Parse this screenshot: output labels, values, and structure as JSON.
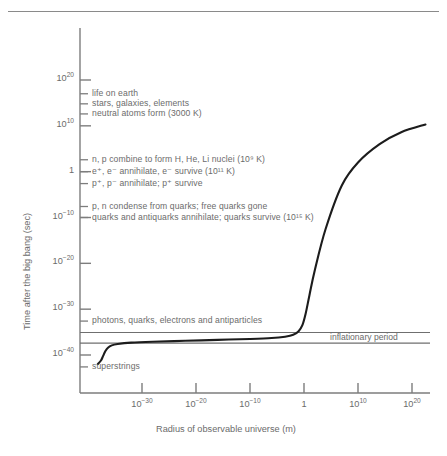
{
  "chart_data": {
    "type": "line",
    "title": "",
    "xlabel": "Radius of observable universe (m)",
    "ylabel": "Time after the big bang (sec)",
    "xscale": "log",
    "yscale": "log",
    "xlim": [
      -45,
      25
    ],
    "ylim": [
      -45,
      25
    ],
    "grid": false,
    "legend": null,
    "xticks": [
      {
        "exp": "-30",
        "base": "10",
        "label": "10⁻³⁰"
      },
      {
        "exp": "-20",
        "base": "10",
        "label": "10⁻²⁰"
      },
      {
        "exp": "-10",
        "base": "10",
        "label": "10⁻¹⁰"
      },
      {
        "exp": "0",
        "base": "1",
        "label": "1"
      },
      {
        "exp": "10",
        "base": "10",
        "label": "10¹⁰"
      },
      {
        "exp": "20",
        "base": "10",
        "label": "10²⁰"
      }
    ],
    "yticks": [
      {
        "exp": "20",
        "base": "10",
        "label": "10²⁰"
      },
      {
        "exp": "10",
        "base": "10",
        "label": "10¹⁰"
      },
      {
        "exp": "0",
        "base": "1",
        "label": "1"
      },
      {
        "exp": "-10",
        "base": "10",
        "label": "10⁻¹⁰"
      },
      {
        "exp": "-20",
        "base": "10",
        "label": "10⁻²⁰"
      },
      {
        "exp": "-30",
        "base": "10",
        "label": "10⁻³⁰"
      },
      {
        "exp": "-40",
        "base": "10",
        "label": "10⁻⁴⁰"
      }
    ],
    "series": [
      {
        "name": "universe expansion",
        "points": [
          [
            -38.2,
            -42.0
          ],
          [
            -37.6,
            -41.2
          ],
          [
            -37.2,
            -40.2
          ],
          [
            -36.8,
            -39.2
          ],
          [
            -36.3,
            -38.4
          ],
          [
            -35.6,
            -37.9
          ],
          [
            -34.5,
            -37.6
          ],
          [
            -32.0,
            -37.3
          ],
          [
            -28.0,
            -37.1
          ],
          [
            -22.0,
            -36.9
          ],
          [
            -16.0,
            -36.7
          ],
          [
            -10.0,
            -36.5
          ],
          [
            -6.0,
            -36.3
          ],
          [
            -3.5,
            -36.0
          ],
          [
            -2.0,
            -35.6
          ],
          [
            -1.0,
            -34.8
          ],
          [
            -0.3,
            -33.5
          ],
          [
            0.3,
            -31.0
          ],
          [
            1.0,
            -27.0
          ],
          [
            2.0,
            -21.5
          ],
          [
            4.0,
            -12.5
          ],
          [
            7.0,
            -3.0
          ],
          [
            10.0,
            2.0
          ],
          [
            14.0,
            6.0
          ],
          [
            18.0,
            8.6
          ],
          [
            22.5,
            10.3
          ]
        ]
      }
    ],
    "event_annotations": [
      {
        "id": "life-on-earth",
        "label": "life on earth",
        "y_exp": 17.0
      },
      {
        "id": "stars-galaxies-elements",
        "label": "stars, galaxies, elements",
        "y_exp": 14.8
      },
      {
        "id": "neutral-atoms-form",
        "label": "neutral atoms form (3000 K)",
        "y_exp": 12.6
      },
      {
        "id": "nuclei-form",
        "label": "n, p combine to form H, He, Li nuclei (10⁹ K)",
        "y_exp": 2.6
      },
      {
        "id": "electron-annihilation",
        "label": "e⁺, e⁻ annihilate, e⁻ survive (10¹¹ K)",
        "y_exp": 0.0
      },
      {
        "id": "proton-annihilation",
        "label": "p⁺, p⁻ annihilate; p⁺ survive",
        "y_exp": -2.6
      },
      {
        "id": "quark-condensation",
        "label": "p, n condense from quarks; free quarks gone",
        "y_exp": -7.6
      },
      {
        "id": "quark-annihilation",
        "label": "quarks and antiquarks annihilate; quarks survive (10¹⁵ K)",
        "y_exp": -10.0
      },
      {
        "id": "photons-quarks-electrons",
        "label": "photons, quarks, electrons and antiparticles",
        "y_exp": -32.6
      },
      {
        "id": "superstrings",
        "label": "superstrings",
        "y_exp": -42.6
      }
    ],
    "band_annotation": {
      "label": "inflationary period",
      "upper_y_exp": -35.1,
      "lower_y_exp": -37.4
    }
  }
}
